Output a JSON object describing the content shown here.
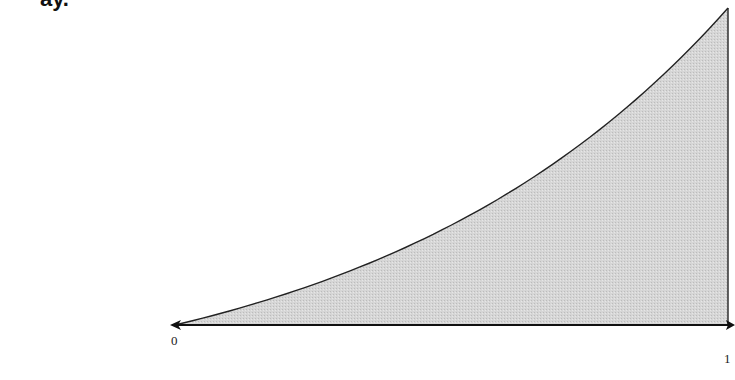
{
  "figure": {
    "top_cropped_text": "ay.",
    "x_axis": {
      "tick_labels": [
        "0",
        "1"
      ]
    },
    "region": {
      "fill_color": "#d4d4d4",
      "stroke_color": "#222222",
      "description": "Shaded area under an increasing convex curve from x=0 to x=1"
    },
    "curve_points": [
      {
        "x": 0.0,
        "y": 0.0
      },
      {
        "x": 0.25,
        "y": 0.16
      },
      {
        "x": 0.41,
        "y": 0.3
      },
      {
        "x": 0.52,
        "y": 0.39
      },
      {
        "x": 0.66,
        "y": 0.54
      },
      {
        "x": 0.8,
        "y": 0.71
      },
      {
        "x": 1.0,
        "y": 1.0
      }
    ]
  }
}
